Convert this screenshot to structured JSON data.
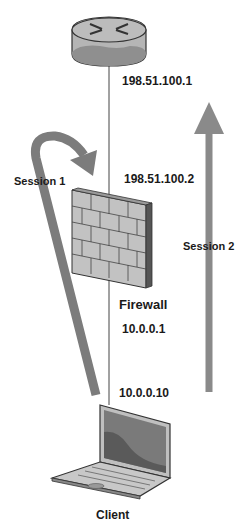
{
  "diagram": {
    "nodes": {
      "router": {
        "icon": "router-icon",
        "ip_upper": "198.51.100.1"
      },
      "firewall": {
        "icon": "firewall-icon",
        "label": "Firewall",
        "ip_outside": "198.51.100.2",
        "ip_inside": "10.0.0.1"
      },
      "client": {
        "icon": "laptop-icon",
        "label": "Client",
        "ip": "10.0.0.10"
      }
    },
    "sessions": [
      {
        "label": "Session 1",
        "from": "client",
        "to": "firewall",
        "style": "curved-return-arrow"
      },
      {
        "label": "Session 2",
        "from": "client",
        "to": "router",
        "style": "straight-up-arrow"
      }
    ],
    "colors": {
      "arrow": "#808080",
      "device_fill": "#b8b8b8",
      "device_dark": "#8c8c8c",
      "outline": "#333333",
      "link": "#444444",
      "text": "#1a1a1a"
    }
  }
}
